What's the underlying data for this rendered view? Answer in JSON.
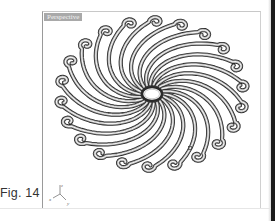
{
  "viewport": {
    "label": "Perspective",
    "model": {
      "name": "spiral-rosette",
      "arm_count": 22,
      "center": [
        109,
        82
      ],
      "hub_rx": 9,
      "hub_ry": 6,
      "outer_rx": 100,
      "outer_ry": 80,
      "stroke_color": "#2a2a2a",
      "highlight_color": "#f4f4f4",
      "point_marker": [
        147,
        136
      ]
    },
    "axis_triad": {
      "x_label": "x",
      "y_label": "y",
      "z_label": "z"
    }
  },
  "caption": {
    "text": "Fig. 14"
  },
  "colors": {
    "label_bg": "#a9a9a9",
    "frame": "#9a9a9a",
    "edge_strip": "#1a1a1a"
  }
}
